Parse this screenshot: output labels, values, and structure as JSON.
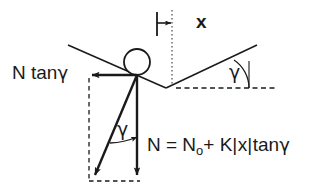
{
  "figure": {
    "background_color": "#ffffff",
    "stroke_color": "#1a1a1a",
    "labels": {
      "horizontal_force": "N tan",
      "horizontal_force_symbol": "γ",
      "displacement": "x",
      "angle_right": "γ",
      "angle_inner": "γ",
      "equation_lead": "N = N",
      "equation_subscript": "o",
      "equation_tail": "+ K",
      "equation_bar_open": "|",
      "equation_abs": "x",
      "equation_bar_close": "|",
      "equation_tan": "tan",
      "equation_gamma": "γ"
    },
    "geometry": {
      "ball_center_x": 137,
      "ball_center_y": 62,
      "ball_radius": 13,
      "vertex_x": 137,
      "vertex_y": 75,
      "notch_bottom_x": 166,
      "notch_bottom_y": 88,
      "dotted_axis_x": 172,
      "dotted_axis_top_y": 10,
      "dotted_axis_bottom_y": 86,
      "tick_x": 157,
      "tick_top_y": 12,
      "tick_bottom_y": 36,
      "gap_arrow_y": 23,
      "horizontal_arrow_tip_x": 89,
      "horizontal_arrow_y": 75,
      "vertical_arrow_tip_y": 180,
      "resultant_tip_x": 92,
      "resultant_tip_y": 179,
      "left_slope_start_x": 68,
      "left_slope_start_y": 45,
      "right_slope_end_x": 257,
      "right_slope_end_y": 45,
      "dashed_ref_start_x": 176,
      "dashed_ref_end_x": 276,
      "dashed_ref_y": 88
    }
  }
}
